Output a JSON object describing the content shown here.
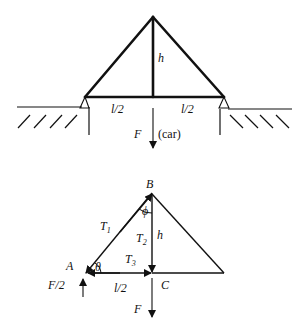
{
  "top_diagram": {
    "title": "Truss bridge with car load",
    "labels": {
      "height": "h",
      "left_half_span": "l/2",
      "right_half_span": "l/2",
      "force": "F",
      "force_note": "(car)"
    }
  },
  "bottom_diagram": {
    "title": "Free body diagram of joints",
    "labels": {
      "node_a": "A",
      "node_b": "B",
      "node_c": "C",
      "t1": "T",
      "t1_sub": "1",
      "t2": "T",
      "t2_sub": "2",
      "t3": "T",
      "t3_sub": "3",
      "height": "h",
      "half_span": "l/2",
      "angle_theta": "θ",
      "angle_phi": "ϕ",
      "reaction": "F/2",
      "force": "F"
    }
  },
  "colors": {
    "stroke": "#111111",
    "background": "#ffffff"
  }
}
